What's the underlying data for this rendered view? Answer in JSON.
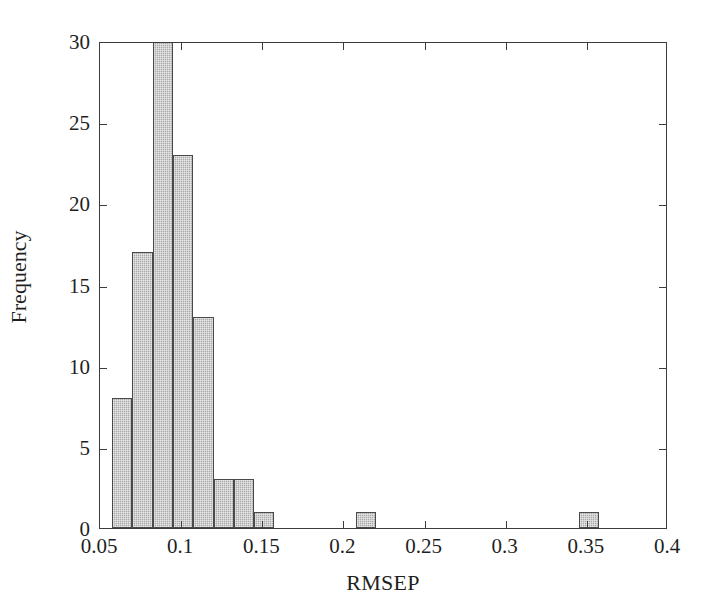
{
  "chart_data": {
    "type": "bar",
    "title": "",
    "subtitle": "",
    "xlabel": "RMSEP",
    "ylabel": "Frequency",
    "xlim": [
      0.05,
      0.4
    ],
    "ylim": [
      0,
      30
    ],
    "grid": false,
    "legend": null,
    "bin_width": 0.0125,
    "xticks": [
      "0.05",
      "0.1",
      "0.15",
      "0.2",
      "0.25",
      "0.3",
      "0.35",
      "0.4"
    ],
    "xtick_values": [
      0.05,
      0.1,
      0.15,
      0.2,
      0.25,
      0.3,
      0.35,
      0.4
    ],
    "yticks": [
      "0",
      "5",
      "10",
      "15",
      "20",
      "25",
      "30"
    ],
    "ytick_values": [
      0,
      5,
      10,
      15,
      20,
      25,
      30
    ],
    "bar_color": "#aaaaaa",
    "bar_edge_color": "#4a4a4a",
    "axis_color": "#3c3c3c",
    "background_color": "#ffffff",
    "note": "Top bar is clipped by the y-axis limit of 30",
    "bins": [
      {
        "x0": 0.0575,
        "x1": 0.07,
        "value": 8
      },
      {
        "x0": 0.07,
        "x1": 0.0825,
        "value": 17
      },
      {
        "x0": 0.0825,
        "x1": 0.095,
        "value": 30
      },
      {
        "x0": 0.095,
        "x1": 0.1075,
        "value": 23
      },
      {
        "x0": 0.1075,
        "x1": 0.12,
        "value": 13
      },
      {
        "x0": 0.12,
        "x1": 0.1325,
        "value": 3
      },
      {
        "x0": 0.1325,
        "x1": 0.145,
        "value": 3
      },
      {
        "x0": 0.145,
        "x1": 0.1575,
        "value": 1
      },
      {
        "x0": 0.2075,
        "x1": 0.22,
        "value": 1
      },
      {
        "x0": 0.345,
        "x1": 0.3575,
        "value": 1
      }
    ],
    "categories": [
      "0.0575-0.07",
      "0.07-0.0825",
      "0.0825-0.095",
      "0.095-0.1075",
      "0.1075-0.12",
      "0.12-0.1325",
      "0.1325-0.145",
      "0.145-0.1575",
      "0.2075-0.22",
      "0.345-0.3575"
    ],
    "values": [
      8,
      17,
      30,
      23,
      13,
      3,
      3,
      1,
      1,
      1
    ]
  }
}
